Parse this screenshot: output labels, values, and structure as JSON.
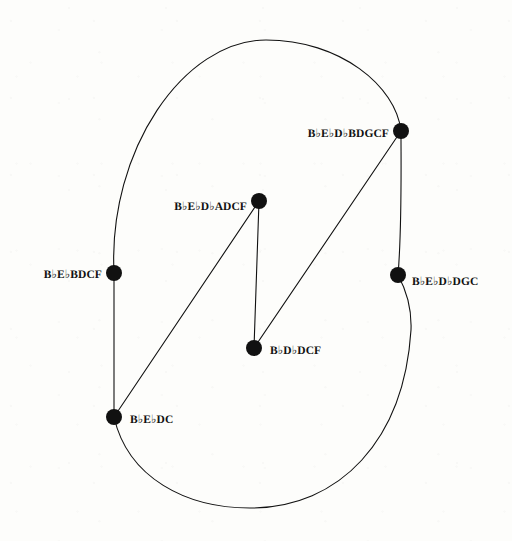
{
  "diagram": {
    "kind": "node-link-graph",
    "title": "",
    "background_color": "#fdfdfb",
    "ink_color": "#111111",
    "node_radius": 8,
    "edge_width": 1.1,
    "nodes": [
      {
        "id": "n-top-right",
        "label": "B♭E♭D♭BDGCF",
        "x": 401,
        "y": 131,
        "label_x": 389,
        "label_y": 133,
        "label_side": "left"
      },
      {
        "id": "n-center-top",
        "label": "B♭E♭D♭ADCF",
        "x": 259,
        "y": 201,
        "label_x": 247,
        "label_y": 206,
        "label_side": "left"
      },
      {
        "id": "n-left",
        "label": "B♭E♭BDCF",
        "x": 114,
        "y": 273,
        "label_x": 102,
        "label_y": 274,
        "label_side": "left"
      },
      {
        "id": "n-right",
        "label": "B♭E♭D♭DGC",
        "x": 398,
        "y": 275,
        "label_x": 412,
        "label_y": 281,
        "label_side": "right"
      },
      {
        "id": "n-center-bottom",
        "label": "B♭D♭DCF",
        "x": 254,
        "y": 348,
        "label_x": 270,
        "label_y": 350,
        "label_side": "right"
      },
      {
        "id": "n-bottom-left",
        "label": "B♭E♭DC",
        "x": 114,
        "y": 417,
        "label_x": 130,
        "label_y": 419,
        "label_side": "right"
      }
    ],
    "edges": [
      {
        "id": "edge-left-to-topright-arc",
        "from": "n-left",
        "to": "n-top-right",
        "shape": "arc",
        "path": "M 114 273 C 108 150 184 40 266 40 C 340 40 396 86 401 131"
      },
      {
        "id": "edge-left-to-bottomleft",
        "from": "n-left",
        "to": "n-bottom-left",
        "shape": "line",
        "path": "M 114 273 L 114 417"
      },
      {
        "id": "edge-bottomleft-to-right-arc",
        "from": "n-bottom-left",
        "to": "n-right",
        "shape": "arc",
        "path": "M 114 417 C 128 478 186 508 250 508 C 340 508 404 440 411 330 C 412 305 404 286 398 275"
      },
      {
        "id": "edge-right-to-topright-arc",
        "from": "n-right",
        "to": "n-top-right",
        "shape": "arc",
        "path": "M 398 275 C 402 228 401 172 401 131"
      },
      {
        "id": "edge-bottomleft-to-centertop",
        "from": "n-bottom-left",
        "to": "n-center-top",
        "shape": "line",
        "path": "M 114 417 L 259 201"
      },
      {
        "id": "edge-centertop-to-centerbottom",
        "from": "n-center-top",
        "to": "n-center-bottom",
        "shape": "line",
        "path": "M 259 201 L 254 348"
      },
      {
        "id": "edge-centerbottom-to-topright",
        "from": "n-center-bottom",
        "to": "n-top-right",
        "shape": "line",
        "path": "M 254 348 L 401 131"
      }
    ]
  }
}
